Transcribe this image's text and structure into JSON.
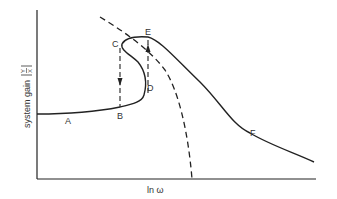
{
  "figure": {
    "xlabel": "ln ω",
    "ylabel": "system gain",
    "ylabel_fraction_num": "Y",
    "ylabel_fraction_den": "X",
    "points": {
      "A": "A",
      "B": "B",
      "C": "C",
      "D": "D",
      "E": "E",
      "F": "F"
    },
    "colors": {
      "line": "#222222",
      "text": "#333333"
    }
  }
}
